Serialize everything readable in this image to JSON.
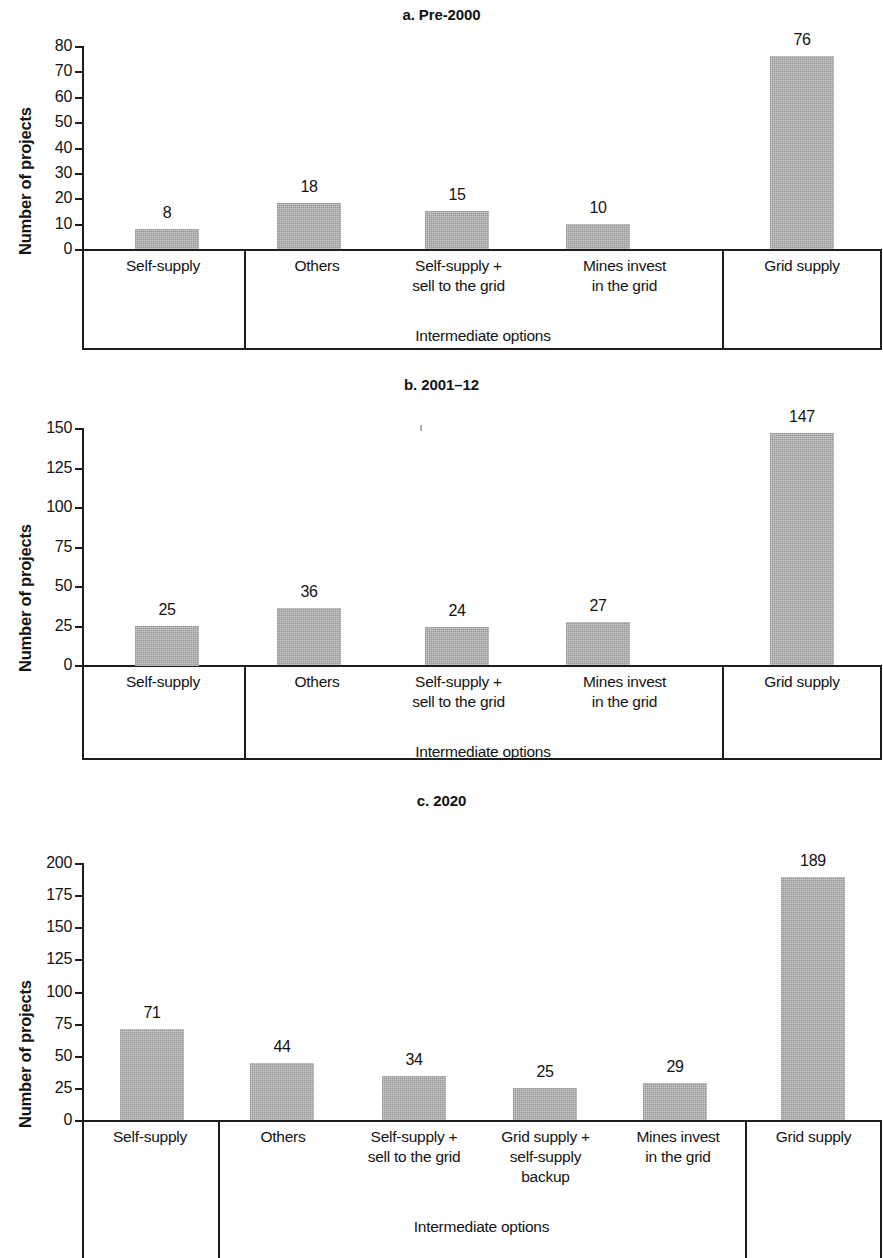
{
  "figure": {
    "ylabel": "Number of projects",
    "group_caption": "Intermediate options",
    "bar_color": "#a9a9a9",
    "axis_color": "#1d1d1d",
    "text_color": "#131313"
  },
  "chart_data": [
    {
      "id": "a",
      "type": "bar",
      "title": "a. Pre-2000",
      "xlabel": "Intermediate options",
      "ylabel": "Number of projects",
      "ylim": [
        0,
        80
      ],
      "ytick_step": 10,
      "yticks": [
        "80",
        "70",
        "60",
        "50",
        "40",
        "30",
        "20",
        "10",
        "0"
      ],
      "grid": false,
      "categories": [
        "Self-supply",
        "Others",
        "Self-supply +\nsell to the grid",
        "Mines invest\nin the grid",
        "Grid supply"
      ],
      "category_lines": [
        [
          "Self-supply"
        ],
        [
          "Others"
        ],
        [
          "Self-supply +",
          "sell to the grid"
        ],
        [
          "Mines invest",
          "in the grid"
        ],
        [
          "Grid supply"
        ]
      ],
      "values": [
        8,
        18,
        15,
        10,
        76
      ],
      "value_labels": [
        "8",
        "18",
        "15",
        "10",
        "76"
      ],
      "groups": [
        {
          "label": "",
          "categories": [
            "Self-supply"
          ]
        },
        {
          "label": "Intermediate options",
          "categories": [
            "Others",
            "Self-supply + sell to the grid",
            "Mines invest in the grid"
          ]
        },
        {
          "label": "",
          "categories": [
            "Grid supply"
          ]
        }
      ]
    },
    {
      "id": "b",
      "type": "bar",
      "title": "b. 2001–12",
      "xlabel": "Intermediate options",
      "ylabel": "Number of projects",
      "ylim": [
        0,
        150
      ],
      "ytick_step": 25,
      "yticks": [
        "150",
        "125",
        "100",
        "75",
        "50",
        "25",
        "0"
      ],
      "grid": false,
      "categories": [
        "Self-supply",
        "Others",
        "Self-supply +\nsell to the grid",
        "Mines invest\nin the grid",
        "Grid supply"
      ],
      "category_lines": [
        [
          "Self-supply"
        ],
        [
          "Others"
        ],
        [
          "Self-supply +",
          "sell to the grid"
        ],
        [
          "Mines invest",
          "in the grid"
        ],
        [
          "Grid supply"
        ]
      ],
      "values": [
        25,
        36,
        24,
        27,
        147
      ],
      "value_labels": [
        "25",
        "36",
        "24",
        "27",
        "147"
      ],
      "groups": [
        {
          "label": "",
          "categories": [
            "Self-supply"
          ]
        },
        {
          "label": "Intermediate options",
          "categories": [
            "Others",
            "Self-supply + sell to the grid",
            "Mines invest in the grid"
          ]
        },
        {
          "label": "",
          "categories": [
            "Grid supply"
          ]
        }
      ]
    },
    {
      "id": "c",
      "type": "bar",
      "title": "c. 2020",
      "xlabel": "Intermediate options",
      "ylabel": "Number of projects",
      "ylim": [
        0,
        200
      ],
      "ytick_step": 25,
      "yticks": [
        "200",
        "175",
        "150",
        "125",
        "100",
        "75",
        "50",
        "25",
        "0"
      ],
      "grid": false,
      "categories": [
        "Self-supply",
        "Others",
        "Self-supply +\nsell to the grid",
        "Grid supply +\nself-supply\nbackup",
        "Mines invest\nin the grid",
        "Grid supply"
      ],
      "category_lines": [
        [
          "Self-supply"
        ],
        [
          "Others"
        ],
        [
          "Self-supply +",
          "sell to the grid"
        ],
        [
          "Grid supply +",
          "self-supply",
          "backup"
        ],
        [
          "Mines invest",
          "in the grid"
        ],
        [
          "Grid supply"
        ]
      ],
      "values": [
        71,
        44,
        34,
        25,
        29,
        189
      ],
      "value_labels": [
        "71",
        "44",
        "34",
        "25",
        "29",
        "189"
      ],
      "groups": [
        {
          "label": "",
          "categories": [
            "Self-supply"
          ]
        },
        {
          "label": "Intermediate options",
          "categories": [
            "Others",
            "Self-supply + sell to the grid",
            "Grid supply + self-supply backup",
            "Mines invest in the grid"
          ]
        },
        {
          "label": "",
          "categories": [
            "Grid supply"
          ]
        }
      ]
    }
  ]
}
